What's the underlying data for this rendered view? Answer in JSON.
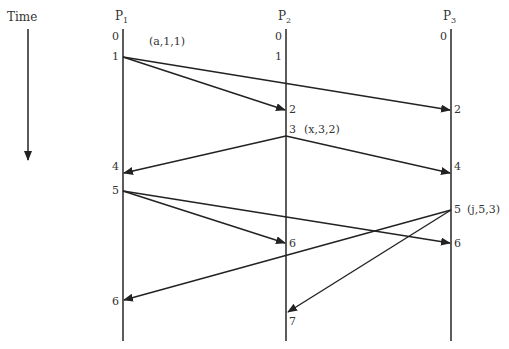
{
  "time_label": "Time",
  "processes": [
    {
      "name": "P",
      "sub": "1",
      "x": 123
    },
    {
      "name": "P",
      "sub": "2",
      "x": 286
    },
    {
      "name": "P",
      "sub": "3",
      "x": 451
    }
  ],
  "events": {
    "p1": [
      {
        "label": "0",
        "y": 38
      },
      {
        "label": "1",
        "y": 57,
        "annotation": "(a,1,1)"
      },
      {
        "label": "4",
        "y": 167
      },
      {
        "label": "5",
        "y": 191
      },
      {
        "label": "6",
        "y": 302
      }
    ],
    "p2": [
      {
        "label": "0",
        "y": 38
      },
      {
        "label": "1",
        "y": 57
      },
      {
        "label": "2",
        "y": 110
      },
      {
        "label": "3",
        "y": 130,
        "annotation": "(x,3,2)"
      },
      {
        "label": "6",
        "y": 243
      },
      {
        "label": "7",
        "y": 322
      }
    ],
    "p3": [
      {
        "label": "0",
        "y": 38
      },
      {
        "label": "2",
        "y": 110
      },
      {
        "label": "4",
        "y": 167
      },
      {
        "label": "5",
        "y": 210,
        "annotation": "(j,5,3)"
      },
      {
        "label": "6",
        "y": 243
      }
    ]
  },
  "messages": [
    {
      "from": "P1 event 1",
      "to": "P2 event 2"
    },
    {
      "from": "P1 event 1",
      "to": "P3 event 2"
    },
    {
      "from": "P2 event 3",
      "to": "P1 event 4"
    },
    {
      "from": "P2 event 3",
      "to": "P3 event 4"
    },
    {
      "from": "P1 event 5",
      "to": "P2 event 6"
    },
    {
      "from": "P1 event 5",
      "to": "P3 event 6"
    },
    {
      "from": "P3 event 5",
      "to": "P1 event 6"
    },
    {
      "from": "P3 event 5",
      "to": "P2 event 7"
    }
  ],
  "annotations": {
    "a": "(a,1,1)",
    "x": "(x,3,2)",
    "j": "(j,5,3)"
  },
  "labels": {
    "p1_0": "0",
    "p1_1": "1",
    "p1_4": "4",
    "p1_5": "5",
    "p1_6": "6",
    "p2_0": "0",
    "p2_1": "1",
    "p2_2": "2",
    "p2_3": "3",
    "p2_6": "6",
    "p2_7": "7",
    "p3_0": "0",
    "p3_2": "2",
    "p3_4": "4",
    "p3_5": "5",
    "p3_6": "6"
  },
  "colors": {
    "line": "#222222",
    "text": "#333333",
    "background": "#ffffff"
  }
}
